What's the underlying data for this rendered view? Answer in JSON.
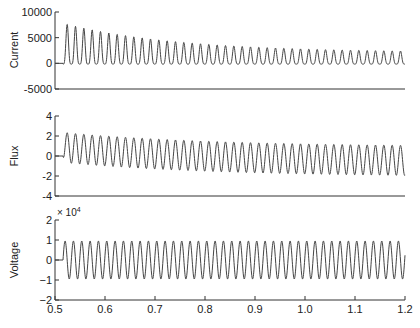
{
  "chart_data": [
    {
      "type": "line",
      "title": "",
      "xlabel": "",
      "ylabel": "Current",
      "xlim": [
        0.5,
        1.2
      ],
      "ylim": [
        -5000,
        10000
      ],
      "yticks": [
        -5000,
        0,
        5000,
        10000
      ],
      "ytick_labels": [
        "-5000",
        "0",
        "5000",
        "10000"
      ],
      "grid": false,
      "series": [
        {
          "name": "Current",
          "description": "Zero until switching at t≈0.516 s, then 60 Hz offset (rectified-like) inrush current with decaying peaks",
          "start_time": 0.516,
          "frequency_hz": 60,
          "peak_values_start": 7800,
          "peak_values_end": 2100,
          "trough_values_start": -100,
          "trough_values_end": -200,
          "sample_peaks": [
            {
              "t": 0.528,
              "value": 7800
            },
            {
              "t": 0.6,
              "value": 6300
            },
            {
              "t": 0.7,
              "value": 4900
            },
            {
              "t": 0.8,
              "value": 3900
            },
            {
              "t": 0.9,
              "value": 3200
            },
            {
              "t": 1.0,
              "value": 2700
            },
            {
              "t": 1.1,
              "value": 2300
            },
            {
              "t": 1.2,
              "value": 2100
            }
          ]
        }
      ]
    },
    {
      "type": "line",
      "title": "",
      "xlabel": "",
      "ylabel": "Flux",
      "xlim": [
        0.5,
        1.2
      ],
      "ylim": [
        -4,
        4
      ],
      "yticks": [
        -4,
        -2,
        0,
        2,
        4
      ],
      "ytick_labels": [
        "-4",
        "-2",
        "0",
        "2",
        "4"
      ],
      "grid": false,
      "series": [
        {
          "name": "Flux",
          "description": "Zero until t≈0.516 s, then 60 Hz sinusoid with decaying positive DC offset",
          "start_time": 0.516,
          "frequency_hz": 60,
          "amplitude": 1.5,
          "dc_offset_start": 0.85,
          "dc_offset_end": -0.6,
          "peak_start": 2.3,
          "trough_start": -0.6,
          "peak_end": 0.9,
          "trough_end": -2.1
        }
      ]
    },
    {
      "type": "line",
      "title": "",
      "xlabel": "",
      "ylabel": "Voltage",
      "y_multiplier_label": "× 10^4",
      "xlim": [
        0.5,
        1.2
      ],
      "ylim": [
        -2,
        2
      ],
      "yticks": [
        -2,
        -1,
        0,
        1,
        2
      ],
      "ytick_labels": [
        "−2",
        "−1",
        "0",
        "1",
        "2"
      ],
      "xticks": [
        0.5,
        0.6,
        0.7,
        0.8,
        0.9,
        1.0,
        1.1,
        1.2
      ],
      "xtick_labels": [
        "0.5",
        "0.6",
        "0.7",
        "0.8",
        "0.9",
        "1.0",
        "1.1",
        "1.2"
      ],
      "grid": false,
      "series": [
        {
          "name": "Voltage",
          "description": "Zero until t≈0.516 s, then steady 60 Hz sinusoid",
          "start_time": 0.516,
          "frequency_hz": 60,
          "amplitude": 0.95,
          "dc_offset": 0
        }
      ]
    }
  ],
  "labels": {
    "current_ylabel": "Current",
    "flux_ylabel": "Flux",
    "voltage_ylabel": "Voltage",
    "voltage_multiplier": "× 10",
    "voltage_multiplier_exp": "4"
  }
}
